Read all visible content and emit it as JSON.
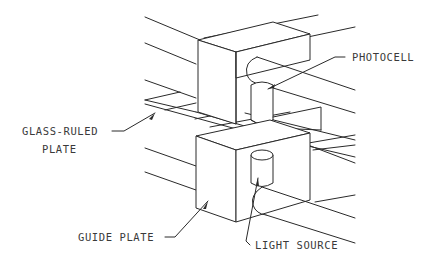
{
  "diagram": {
    "type": "isometric technical illustration",
    "background": "#ffffff",
    "line_color": "#2a2a2a",
    "labels": {
      "photocell": "PHOTOCELL",
      "glass_ruled_line1": "GLASS-RULED",
      "glass_ruled_line2": "PLATE",
      "guide_plate": "GUIDE PLATE",
      "light_source": "LIGHT SOURCE"
    },
    "components": [
      {
        "id": "upper-guide-block",
        "description": "upper rectangular guide block"
      },
      {
        "id": "lower-guide-block",
        "description": "lower rectangular guide block (guide plate)"
      },
      {
        "id": "photocell",
        "description": "cylinder under upper arm"
      },
      {
        "id": "light-source",
        "description": "cylinder above lower arm"
      },
      {
        "id": "glass-ruled-plate",
        "description": "thin plate between blocks"
      },
      {
        "id": "upper-arm",
        "description": "rounded rod from upper block"
      },
      {
        "id": "lower-arm",
        "description": "rounded rod from lower block"
      }
    ]
  }
}
